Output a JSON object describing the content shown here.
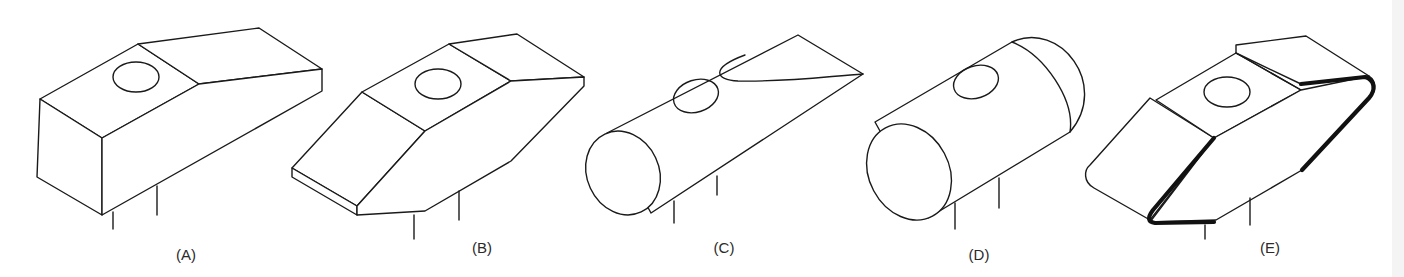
{
  "figure": {
    "panels": [
      {
        "id": "A",
        "label": "(A)",
        "shape": "rectangular block with tapered end and hole"
      },
      {
        "id": "B",
        "label": "(B)",
        "shape": "double-tapered block with hole"
      },
      {
        "id": "C",
        "label": "(C)",
        "shape": "cylinder with wedge-cut end and hole"
      },
      {
        "id": "D",
        "label": "(D)",
        "shape": "cylinder with domed end and hole"
      },
      {
        "id": "E",
        "label": "(E)",
        "shape": "double-tapered block with rounded bold edges and hole"
      }
    ]
  },
  "colors": {
    "stroke": "#1a1a1a",
    "background": "#ffffff"
  }
}
